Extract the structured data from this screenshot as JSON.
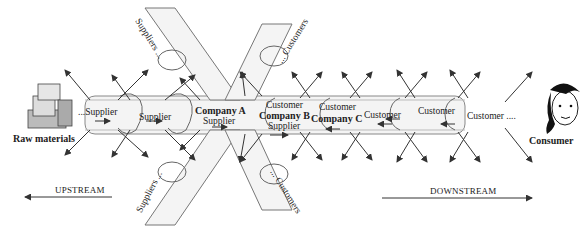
{
  "diagram": {
    "type": "supply-chain",
    "left_end": {
      "label": "Raw materials",
      "icon": "boxes-icon"
    },
    "right_end": {
      "label": "Consumer",
      "icon": "consumer-face-icon"
    },
    "chain_links": [
      {
        "top": "...Supplier",
        "bottom": ""
      },
      {
        "top": "Supplier",
        "bottom": ""
      },
      {
        "top": "Company A",
        "bottom": "Supplier"
      },
      {
        "top": "Customer",
        "middle": "Company B",
        "bottom": "Supplier"
      },
      {
        "top": "Customer",
        "middle": "Company C",
        "bottom": ""
      },
      {
        "top": "Customer",
        "bottom": ""
      },
      {
        "top": "Customer",
        "bottom": ""
      },
      {
        "top": "Customer ....",
        "bottom": ""
      }
    ],
    "branch_labels": {
      "suppliers_top": "Suppliers ...",
      "suppliers_bottom": "Suppliers ...",
      "customers_top": "... Customers",
      "customers_bottom": "... Customers"
    },
    "direction": {
      "upstream": "UPSTREAM",
      "downstream": "DOWNSTREAM"
    },
    "colors": {
      "line": "#333333",
      "chain_fill": "#f2f2f2",
      "chain_shade": "#cfcfcf"
    }
  }
}
